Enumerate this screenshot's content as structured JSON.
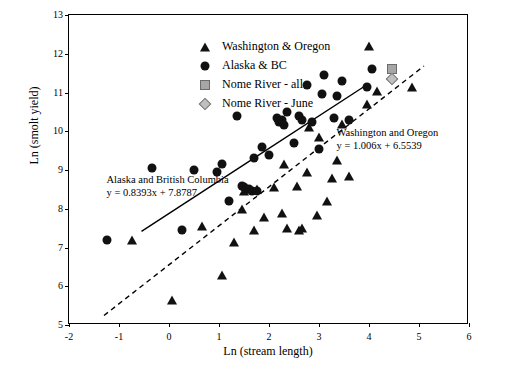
{
  "chart_data": {
    "type": "scatter",
    "title": "",
    "xlabel": "Ln (stream length)",
    "ylabel": "Ln (smolt yield)",
    "xlim": [
      -2,
      6
    ],
    "ylim": [
      5,
      13
    ],
    "xticks": [
      "-2",
      "-1",
      "0",
      "1",
      "2",
      "3",
      "4",
      "5",
      "6"
    ],
    "yticks": [
      "5",
      "6",
      "7",
      "8",
      "9",
      "10",
      "11",
      "12",
      "13"
    ],
    "grid": false,
    "legend_position": "top-left-inside",
    "legend": [
      {
        "label": "Washington & Oregon",
        "marker": "triangle",
        "color": "#111111"
      },
      {
        "label": "Alaska & BC",
        "marker": "circle",
        "color": "#111111"
      },
      {
        "label": "Nome River - all",
        "marker": "square",
        "color": "#a6a6a6"
      },
      {
        "label": "Nome River - June",
        "marker": "diamond",
        "color": "#bfbfbf"
      }
    ],
    "annotations": [
      {
        "name": "alaska-bc-regression-label",
        "line1": "Alaska and British Columbia",
        "line2": "y = 0.8393x + 7.8787",
        "x": -1.25,
        "y": 8.75
      },
      {
        "name": "washington-oregon-regression-label",
        "line1": "Washington and Oregon",
        "line2": "y = 1.006x + 6.5539",
        "x": 3.35,
        "y": 9.95
      }
    ],
    "trendlines": [
      {
        "name": "Alaska and British Columbia",
        "equation": "y = 0.8393x + 7.8787",
        "slope": 0.8393,
        "intercept": 7.8787,
        "style": "solid",
        "x_start": -0.55,
        "x_end": 3.95
      },
      {
        "name": "Washington and Oregon",
        "equation": "y = 1.006x + 6.5539",
        "slope": 1.006,
        "intercept": 6.5539,
        "style": "dashed",
        "x_start": -1.3,
        "x_end": 5.1
      }
    ],
    "series": [
      {
        "name": "Washington & Oregon",
        "marker": "triangle",
        "points": [
          [
            -0.75,
            7.2
          ],
          [
            0.05,
            5.65
          ],
          [
            0.65,
            7.55
          ],
          [
            1.05,
            6.3
          ],
          [
            1.3,
            7.15
          ],
          [
            1.45,
            8.0
          ],
          [
            1.5,
            8.45
          ],
          [
            1.7,
            7.45
          ],
          [
            1.75,
            8.5
          ],
          [
            1.9,
            7.8
          ],
          [
            2.1,
            8.55
          ],
          [
            2.25,
            7.9
          ],
          [
            2.3,
            9.15
          ],
          [
            2.35,
            7.5
          ],
          [
            2.55,
            8.6
          ],
          [
            2.6,
            7.45
          ],
          [
            2.65,
            7.5
          ],
          [
            2.75,
            8.95
          ],
          [
            2.8,
            10.1
          ],
          [
            2.95,
            7.85
          ],
          [
            3.0,
            9.85
          ],
          [
            3.15,
            8.2
          ],
          [
            3.25,
            8.8
          ],
          [
            3.35,
            9.25
          ],
          [
            3.45,
            10.2
          ],
          [
            3.6,
            8.85
          ],
          [
            3.95,
            10.7
          ],
          [
            4.0,
            12.2
          ],
          [
            4.15,
            11.05
          ],
          [
            4.85,
            11.15
          ]
        ]
      },
      {
        "name": "Alaska & BC",
        "marker": "circle",
        "points": [
          [
            -1.25,
            7.2
          ],
          [
            -0.35,
            9.05
          ],
          [
            0.25,
            7.45
          ],
          [
            0.5,
            9.0
          ],
          [
            0.95,
            8.95
          ],
          [
            1.05,
            9.15
          ],
          [
            1.2,
            8.2
          ],
          [
            1.35,
            10.4
          ],
          [
            1.45,
            8.6
          ],
          [
            1.5,
            8.55
          ],
          [
            1.6,
            8.5
          ],
          [
            1.65,
            8.45
          ],
          [
            1.7,
            9.3
          ],
          [
            1.75,
            8.45
          ],
          [
            1.85,
            9.6
          ],
          [
            2.0,
            9.4
          ],
          [
            2.15,
            10.35
          ],
          [
            2.2,
            10.25
          ],
          [
            2.25,
            10.3
          ],
          [
            2.3,
            10.15
          ],
          [
            2.35,
            10.5
          ],
          [
            2.5,
            9.7
          ],
          [
            2.6,
            10.4
          ],
          [
            2.65,
            10.3
          ],
          [
            2.75,
            11.2
          ],
          [
            2.85,
            10.25
          ],
          [
            3.0,
            9.55
          ],
          [
            3.05,
            10.95
          ],
          [
            3.1,
            11.45
          ],
          [
            3.3,
            10.35
          ],
          [
            3.35,
            10.9
          ],
          [
            3.45,
            11.3
          ],
          [
            3.6,
            10.3
          ],
          [
            3.95,
            11.15
          ],
          [
            4.05,
            11.6
          ]
        ]
      },
      {
        "name": "Nome River - all",
        "marker": "square",
        "points": [
          [
            4.45,
            11.6
          ]
        ]
      },
      {
        "name": "Nome River - June",
        "marker": "diamond",
        "points": [
          [
            4.45,
            11.35
          ]
        ]
      }
    ]
  }
}
